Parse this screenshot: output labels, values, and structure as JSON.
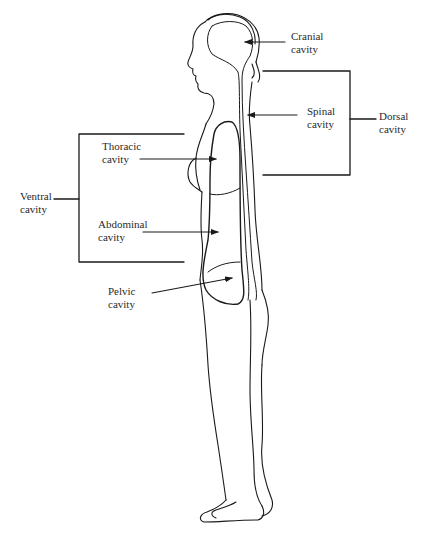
{
  "diagram": {
    "type": "anatomical body cavities (lateral view)",
    "labels": {
      "cranial": {
        "line1": "Cranial",
        "line2": "cavity"
      },
      "spinal": {
        "line1": "Spinal",
        "line2": "cavity"
      },
      "dorsal": {
        "line1": "Dorsal",
        "line2": "cavity"
      },
      "thoracic": {
        "line1": "Thoracic",
        "line2": "cavity"
      },
      "ventral": {
        "line1": "Ventral",
        "line2": "cavity"
      },
      "abdominal": {
        "line1": "Abdominal",
        "line2": "cavity"
      },
      "pelvic": {
        "line1": "Pelvic",
        "line2": "cavity"
      }
    },
    "groups": {
      "dorsal": [
        "Cranial cavity",
        "Spinal cavity"
      ],
      "ventral": [
        "Thoracic cavity",
        "Abdominal cavity"
      ]
    },
    "colors": {
      "line": "#1a1a1a",
      "background": "#ffffff",
      "text": "#2a2a2a"
    }
  }
}
